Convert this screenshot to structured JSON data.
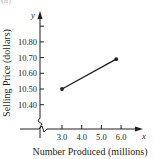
{
  "caption": "(a)",
  "chart_data": {
    "type": "line",
    "title": "",
    "xlabel": "Number Produced (millions)",
    "ylabel": "Selling Price (dollars)",
    "x_axis_var": "x",
    "y_axis_var": "y",
    "x_ticks": [
      "3.0",
      "4.0",
      "5.0",
      "6.0"
    ],
    "y_ticks": [
      "10.40",
      "10.50",
      "10.60",
      "10.70",
      "10.80"
    ],
    "xlim": [
      0,
      7
    ],
    "ylim": [
      10.3,
      10.9
    ],
    "axis_breaks": [
      "x",
      "y"
    ],
    "grid": false,
    "legend": null,
    "series": [
      {
        "name": "selling price",
        "points": [
          {
            "x": 3.0,
            "y": 10.5
          },
          {
            "x": 5.75,
            "y": 10.69
          }
        ],
        "color": "#231f20",
        "markers": true
      }
    ]
  }
}
